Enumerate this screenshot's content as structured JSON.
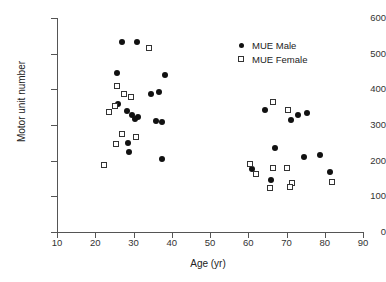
{
  "chart_data": {
    "type": "scatter",
    "title": "",
    "xlabel": "Age (yr)",
    "ylabel": "Motor unit number",
    "xlim": [
      10,
      90
    ],
    "ylim": [
      0,
      600
    ],
    "xticks": [
      10,
      20,
      30,
      40,
      50,
      60,
      70,
      80,
      90
    ],
    "yticks": [
      0,
      100,
      200,
      300,
      400,
      500,
      600
    ],
    "grid": false,
    "legend_position": "upper right",
    "series": [
      {
        "name": "MUE Male",
        "marker": "filled-circle",
        "color": "#111111",
        "points": [
          [
            27.0,
            534
          ],
          [
            30.9,
            534
          ],
          [
            25.7,
            446
          ],
          [
            28.4,
            340
          ],
          [
            29.6,
            328
          ],
          [
            31.2,
            322
          ],
          [
            30.4,
            318
          ],
          [
            28.6,
            250
          ],
          [
            28.9,
            224
          ],
          [
            34.5,
            388
          ],
          [
            36.6,
            392
          ],
          [
            38.3,
            440
          ],
          [
            36.0,
            312
          ],
          [
            37.5,
            308
          ],
          [
            37.4,
            204
          ],
          [
            26.0,
            360
          ],
          [
            64.4,
            342
          ],
          [
            71.2,
            314
          ],
          [
            73.0,
            328
          ],
          [
            75.3,
            334
          ],
          [
            60.9,
            176
          ],
          [
            74.5,
            210
          ],
          [
            78.8,
            216
          ],
          [
            67.0,
            236
          ],
          [
            66.0,
            146
          ],
          [
            81.5,
            168
          ]
        ]
      },
      {
        "name": "MUE Female",
        "marker": "open-square",
        "color": "#333333",
        "points": [
          [
            34.0,
            516
          ],
          [
            25.8,
            410
          ],
          [
            27.4,
            388
          ],
          [
            29.4,
            378
          ],
          [
            25.2,
            352
          ],
          [
            23.6,
            336
          ],
          [
            27.0,
            276
          ],
          [
            25.5,
            248
          ],
          [
            22.3,
            188
          ],
          [
            30.6,
            266
          ],
          [
            70.5,
            342
          ],
          [
            66.5,
            364
          ],
          [
            60.4,
            190
          ],
          [
            66.6,
            180
          ],
          [
            70.2,
            180
          ],
          [
            62.1,
            162
          ],
          [
            71.4,
            138
          ],
          [
            65.8,
            122
          ],
          [
            70.8,
            126
          ],
          [
            81.8,
            140
          ]
        ]
      }
    ]
  },
  "legend": {
    "entries": [
      {
        "label": "MUE Male",
        "marker": "filled-circle"
      },
      {
        "label": "MUE Female",
        "marker": "open-square"
      }
    ]
  },
  "axes": {
    "x_title": "Age (yr)",
    "y_title": "Motor unit number",
    "x_tick_labels": [
      "10",
      "20",
      "30",
      "40",
      "50",
      "60",
      "70",
      "80",
      "90"
    ],
    "y_tick_labels": [
      "0",
      "100",
      "200",
      "300",
      "400",
      "500",
      "600"
    ]
  }
}
